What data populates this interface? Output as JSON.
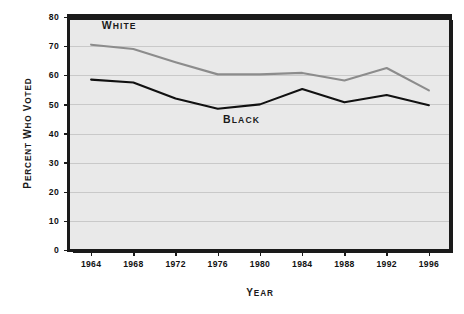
{
  "chart_data": {
    "type": "line",
    "title": "",
    "xlabel": "Year",
    "ylabel": "Percent Who Voted",
    "categories": [
      "1964",
      "1968",
      "1972",
      "1976",
      "1980",
      "1984",
      "1988",
      "1992",
      "1996"
    ],
    "x": [
      1964,
      1968,
      1972,
      1976,
      1980,
      1984,
      1988,
      1992,
      1996
    ],
    "xlim": [
      1962,
      1998
    ],
    "ylim": [
      0,
      80
    ],
    "yticks": [
      0,
      10,
      20,
      30,
      40,
      50,
      60,
      70,
      80
    ],
    "ytick_labels": [
      "0",
      "10",
      "20",
      "30",
      "40",
      "50",
      "60",
      "70",
      "80"
    ],
    "grid": true,
    "grid_axis": "y",
    "legend": "inline-annotations",
    "series": [
      {
        "name": "White",
        "label": "White",
        "color": "#8c8c8c",
        "values": [
          70.5,
          69.0,
          64.5,
          60.3,
          60.3,
          60.8,
          58.2,
          62.5,
          54.8
        ]
      },
      {
        "name": "Black",
        "label": "Black",
        "color": "#111111",
        "values": [
          58.5,
          57.5,
          52.0,
          48.5,
          50.0,
          55.3,
          50.7,
          53.2,
          49.7
        ]
      }
    ],
    "annotations": [
      {
        "text": "White",
        "series": "White",
        "x": 1965.0,
        "y": 76.0
      },
      {
        "text": "Black",
        "series": "Black",
        "x": 1976.5,
        "y": 43.5
      }
    ]
  },
  "axes": {
    "y_title": "Percent Who Voted",
    "x_title": "Year"
  },
  "style": {
    "plot_background": "#e9e9e9",
    "page_background": "#ffffff",
    "frame_color": "#1a1a1a",
    "grid_color": "#c9c9c9",
    "white_series_color": "#8c8c8c",
    "black_series_color": "#111111"
  }
}
